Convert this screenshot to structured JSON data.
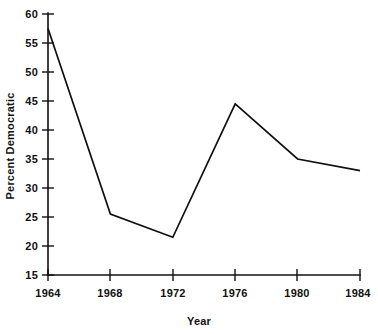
{
  "chart_data": {
    "type": "line",
    "title": "",
    "subtitle": "",
    "xlabel": "Year",
    "ylabel": "Percent Democratic",
    "x": [
      1964,
      1968,
      1972,
      1976,
      1980,
      1984
    ],
    "categories": [
      "1964",
      "1968",
      "1972",
      "1976",
      "1980",
      "1984"
    ],
    "values": [
      57.5,
      25.5,
      21.5,
      44.5,
      35.0,
      33.0
    ],
    "series": [
      {
        "name": "Percent Democratic",
        "values": [
          57.5,
          25.5,
          21.5,
          44.5,
          35.0,
          33.0
        ]
      }
    ],
    "xlim": [
      1964,
      1984
    ],
    "ylim": [
      15,
      60
    ],
    "xticks": [
      1964,
      1968,
      1972,
      1976,
      1980,
      1984
    ],
    "yticks": [
      15,
      20,
      25,
      30,
      35,
      40,
      45,
      50,
      55,
      60
    ],
    "xtick_labels": [
      "1964",
      "1968",
      "1972",
      "1976",
      "1980",
      "1984"
    ],
    "ytick_labels": [
      "15",
      "20",
      "25",
      "30",
      "35",
      "40",
      "45",
      "50",
      "55",
      "60"
    ],
    "grid": false,
    "legend": false,
    "legend_position": "none",
    "line_color": "#101010",
    "background_color": "#ffffff",
    "markers": false,
    "annotations": []
  },
  "axes": {
    "y_title": "Percent Democratic",
    "x_title": "Year",
    "y_labels": {
      "t60": "60",
      "t55": "55",
      "t50": "50",
      "t45": "45",
      "t40": "40",
      "t35": "35",
      "t30": "30",
      "t25": "25",
      "t20": "20",
      "t15": "15"
    },
    "x_labels": {
      "t1964": "1964",
      "t1968": "1968",
      "t1972": "1972",
      "t1976": "1976",
      "t1980": "1980",
      "t1984": "1984"
    }
  }
}
